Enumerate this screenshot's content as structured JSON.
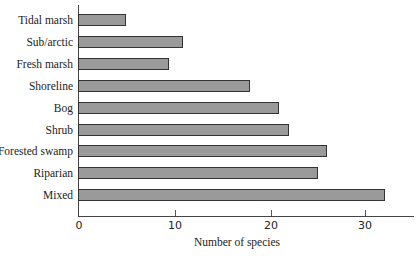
{
  "chart_data": {
    "type": "bar",
    "orientation": "horizontal",
    "title": "",
    "xlabel": "Number of species",
    "ylabel": "",
    "categories": [
      "Tidal marsh",
      "Sub/arctic",
      "Fresh marsh",
      "Shoreline",
      "Bog",
      "Shrub",
      "Forested swamp",
      "Riparian",
      "Mixed"
    ],
    "values": [
      5,
      11,
      9.5,
      18,
      21,
      22,
      26,
      25,
      32
    ],
    "xlim": [
      0,
      35
    ],
    "xticks": [
      0,
      10,
      20,
      30
    ],
    "xtick_labels": [
      "0",
      "10",
      "20",
      "30"
    ],
    "grid": false,
    "legend": null,
    "bar_color": "#9a9a9a",
    "bar_edge_color": "#333333"
  }
}
